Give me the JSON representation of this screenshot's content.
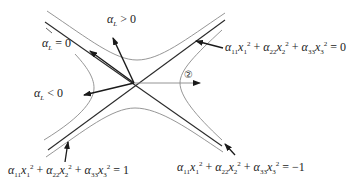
{
  "diagram": {
    "center": {
      "x": 134,
      "y": 83
    },
    "labels": {
      "alpha_L_pos": {
        "sym": "α",
        "sub": "L",
        "rel": " > 0"
      },
      "alpha_L_zero": {
        "sym": "α",
        "sub": "L",
        "rel": " = 0"
      },
      "alpha_L_neg": {
        "sym": "α",
        "sub": "L",
        "rel": " < 0"
      },
      "circled_two": "②"
    },
    "equations": {
      "cone": {
        "t1c": "α",
        "t1s": "11",
        "t1v": "x",
        "t1vs": "1",
        "t2c": "α",
        "t2s": "22",
        "t2v": "x",
        "t2vs": "2",
        "t3c": "α",
        "t3s": "33",
        "t3v": "x",
        "t3vs": "3",
        "exp": "2",
        "plus": " + ",
        "rhs": " = 0"
      },
      "one_sheet": {
        "t1c": "α",
        "t1s": "11",
        "t1v": "x",
        "t1vs": "1",
        "t2c": "α",
        "t2s": "22",
        "t2v": "x",
        "t2vs": "2",
        "t3c": "α",
        "t3s": "33",
        "t3v": "x",
        "t3vs": "3",
        "exp": "2",
        "plus": " + ",
        "rhs": " = 1"
      },
      "two_sheet": {
        "t1c": "α",
        "t1s": "11",
        "t1v": "x",
        "t1vs": "1",
        "t2c": "α",
        "t2s": "22",
        "t2v": "x",
        "t2vs": "2",
        "t3c": "α",
        "t3s": "33",
        "t3v": "x",
        "t3vs": "3",
        "exp": "2",
        "plus": " + ",
        "rhs": " = −1"
      }
    },
    "colors": {
      "asymptote": "#2a2a2a",
      "curve": "#8a8a8a",
      "arrow": "#1a1a1a"
    }
  }
}
